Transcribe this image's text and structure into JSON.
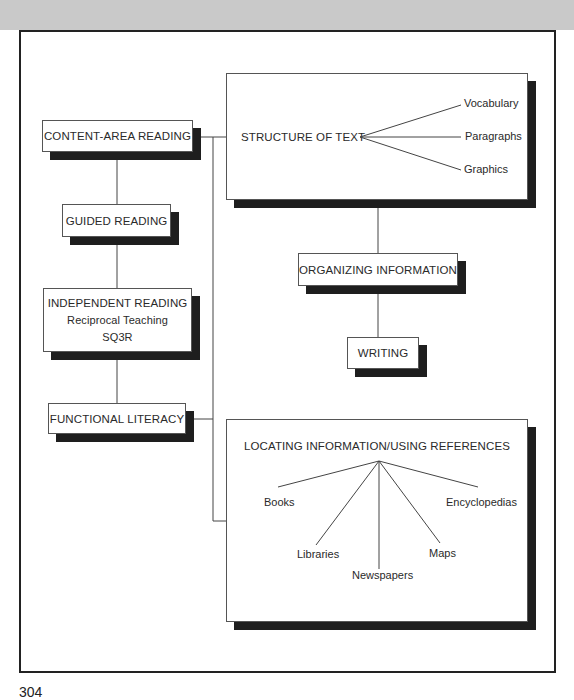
{
  "diagram": {
    "boxes": {
      "content_area_reading": "CONTENT-AREA READING",
      "guided_reading": "GUIDED READING",
      "independent_reading": {
        "title": "INDEPENDENT READING",
        "items": [
          "Reciprocal Teaching",
          "SQ3R"
        ]
      },
      "functional_literacy": "FUNCTIONAL LITERACY",
      "structure_of_text": {
        "title": "STRUCTURE OF TEXT",
        "branches": [
          "Vocabulary",
          "Paragraphs",
          "Graphics"
        ]
      },
      "organizing_information": "ORGANIZING INFORMATION",
      "writing": "WRITING",
      "locating_information": {
        "title": "LOCATING INFORMATION/USING REFERENCES",
        "branches": [
          "Books",
          "Libraries",
          "Newspapers",
          "Maps",
          "Encyclopedias"
        ]
      }
    },
    "page_number": "304"
  },
  "colors": {
    "band": "#c9c9c9",
    "frame": "#222222",
    "shadow": "#1e1e1e",
    "line": "#444444"
  }
}
